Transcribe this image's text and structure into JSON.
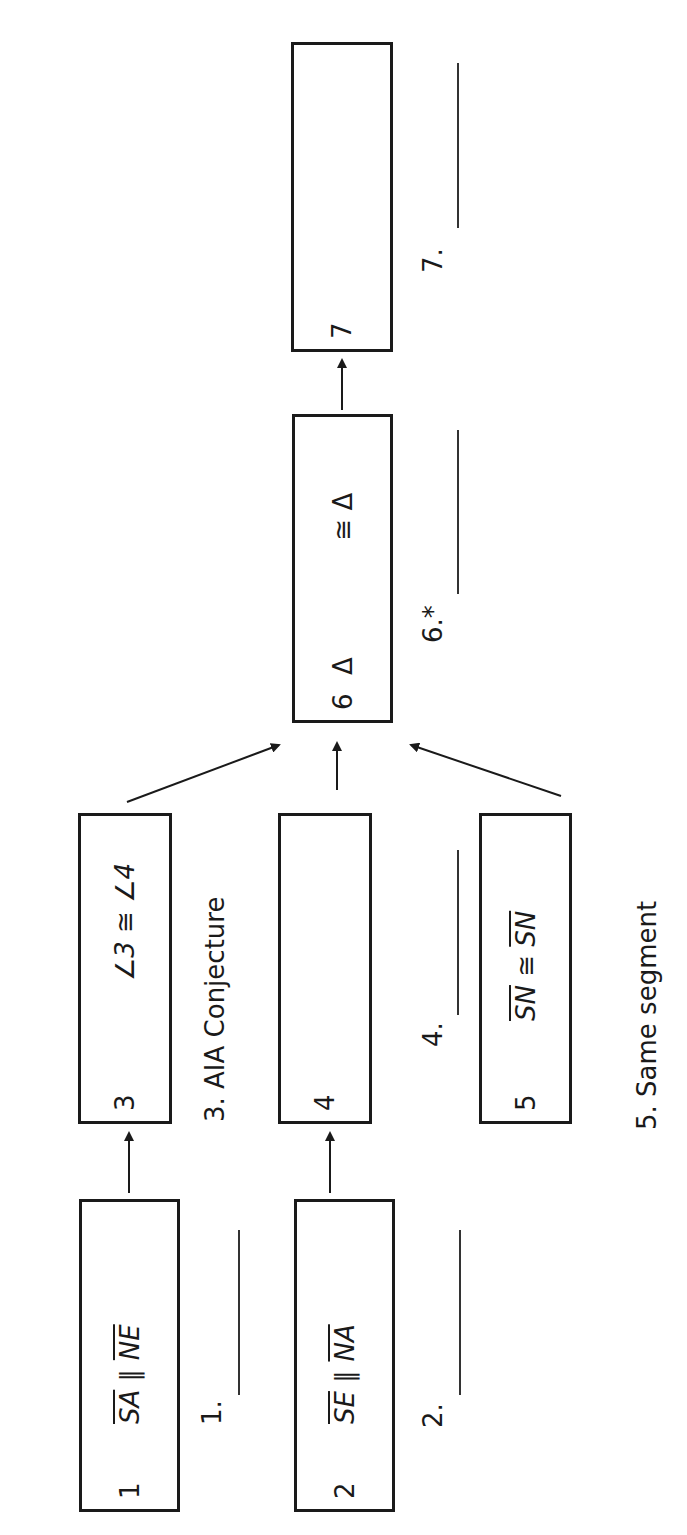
{
  "diagram": {
    "type": "flowchart proof",
    "boxes": [
      {
        "id": 1,
        "num": "1",
        "seg1": "SA",
        "rel": " ∥ ",
        "seg2": "NE",
        "reason_prefix": "1.",
        "reason": ""
      },
      {
        "id": 2,
        "num": "2",
        "seg1": "SE",
        "rel": " ∥ ",
        "seg2": "NA",
        "reason_prefix": "2.",
        "reason": ""
      },
      {
        "id": 3,
        "num": "3",
        "statement": "∠3 ≅ ∠4",
        "reason_prefix": "3.",
        "reason": "AIA Conjecture"
      },
      {
        "id": 4,
        "num": "4",
        "statement": "",
        "reason_prefix": "4.",
        "reason": ""
      },
      {
        "id": 5,
        "num": "5",
        "seg1": "SN",
        "rel": " ≅ ",
        "seg2": "SN",
        "reason_prefix": "5.",
        "reason": "Same segment"
      },
      {
        "id": 6,
        "num": "6",
        "tri1": "Δ",
        "rel": "≅",
        "tri2": "Δ",
        "reason_prefix": "6.*",
        "reason": ""
      },
      {
        "id": 7,
        "num": "7",
        "statement": "",
        "reason_prefix": "7.",
        "reason": ""
      }
    ],
    "edges": [
      {
        "from": 1,
        "to": 3
      },
      {
        "from": 2,
        "to": 4
      },
      {
        "from": 3,
        "to": 6
      },
      {
        "from": 4,
        "to": 6
      },
      {
        "from": 5,
        "to": 6
      },
      {
        "from": 6,
        "to": 7
      }
    ],
    "colors": {
      "stroke": "#1a1a1a",
      "background": "#ffffff"
    }
  }
}
